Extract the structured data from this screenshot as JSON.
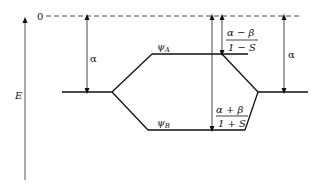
{
  "diagram": {
    "type": "molecular-orbital-energy-diagram",
    "axis": {
      "label": "E",
      "direction": "up"
    },
    "zero_level": {
      "label": "0",
      "style": "dashed"
    },
    "levels": [
      {
        "id": "left-atomic",
        "label": ""
      },
      {
        "id": "psi-a",
        "label": "ψ",
        "subscript": "A"
      },
      {
        "id": "psi-b",
        "label": "ψ",
        "subscript": "B"
      },
      {
        "id": "right-atomic",
        "label": ""
      }
    ],
    "annotations": {
      "left_alpha": "α",
      "right_alpha": "α",
      "antibonding": {
        "numerator": "α − β",
        "denominator": "1 − S"
      },
      "bonding": {
        "numerator": "α + β",
        "denominator": "1 + S"
      }
    },
    "colors": {
      "line": "#111111",
      "axis": "#555555",
      "background": "#ffffff"
    }
  }
}
